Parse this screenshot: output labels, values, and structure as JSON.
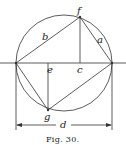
{
  "figure": {
    "caption": "Fig. 30.",
    "labels": {
      "a": "a",
      "b": "b",
      "c": "c",
      "d": "d",
      "e": "e",
      "f": "f",
      "g": "g"
    },
    "ink_color": "#333333",
    "background_color": "#ffffff"
  }
}
